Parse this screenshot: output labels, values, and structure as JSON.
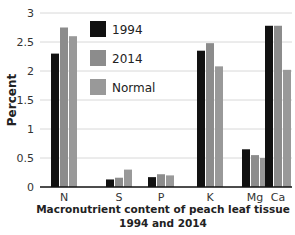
{
  "chart_data": {
    "type": "bar",
    "title": "",
    "xlabel": "Macronutrient content of peach leaf tissue 1994 and 2014",
    "xlabel_lines": [
      "Macronutrient content of peach leaf tissue",
      "1994 and 2014"
    ],
    "ylabel": "Percent",
    "ylim": [
      0,
      3
    ],
    "yticks": [
      0,
      0.5,
      1,
      1.5,
      2,
      2.5,
      3
    ],
    "ytick_labels": [
      "0",
      "0.5",
      "1",
      "1.5",
      "2",
      "2.5",
      "3"
    ],
    "grid": true,
    "legend_position": "upper-left-inside",
    "categories": [
      "N",
      "S",
      "P",
      "K",
      "Mg",
      "Ca"
    ],
    "series": [
      {
        "name": "1994",
        "color": "#111111",
        "values": [
          2.3,
          0.13,
          0.17,
          2.35,
          0.65,
          2.78
        ]
      },
      {
        "name": "2014",
        "color": "#8c8c8c",
        "values": [
          2.75,
          0.16,
          0.22,
          2.48,
          0.55,
          2.78
        ]
      },
      {
        "name": "Normal",
        "color": "#999999",
        "values": [
          2.6,
          0.3,
          0.2,
          2.08,
          0.5,
          2.02
        ]
      }
    ]
  }
}
